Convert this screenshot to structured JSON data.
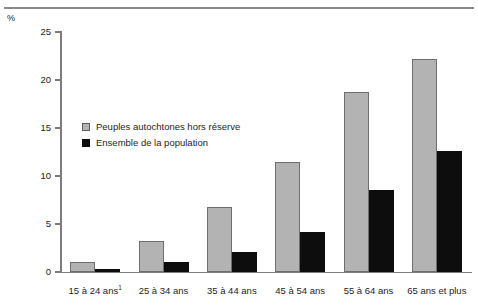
{
  "chart_data": {
    "type": "bar",
    "title": "",
    "subtitle": "",
    "xlabel": "",
    "ylabel": "%",
    "unit_label": "%",
    "ylim": [
      0,
      25
    ],
    "yticks": [
      0,
      5,
      10,
      15,
      20,
      25
    ],
    "ytick_labels": [
      "0",
      "5",
      "10",
      "15",
      "20",
      "25"
    ],
    "grid": false,
    "legend_position": "inside-upper-left",
    "categories": [
      "15 à 24 ans",
      "25 à 34 ans",
      "35 à 44 ans",
      "45 à 54 ans",
      "55 à 64 ans",
      "65 ans et plus"
    ],
    "category_footnotes": [
      "1",
      "",
      "",
      "",
      "",
      ""
    ],
    "series": [
      {
        "name": "Peuples autochtones hors réserve",
        "color": "#b3b3b3",
        "border_color": "#6e6e6e",
        "values": [
          1.0,
          3.2,
          6.8,
          11.5,
          18.8,
          22.2
        ]
      },
      {
        "name": "Ensemble de la population",
        "color": "#0d0d0d",
        "border_color": "#0d0d0d",
        "values": [
          0.3,
          1.0,
          2.1,
          4.2,
          8.5,
          12.6
        ]
      }
    ]
  },
  "legend": {
    "items": [
      {
        "label": "Peuples autochtones hors réserve"
      },
      {
        "label": "Ensemble de la population"
      }
    ]
  },
  "axis": {
    "unit": "%"
  }
}
